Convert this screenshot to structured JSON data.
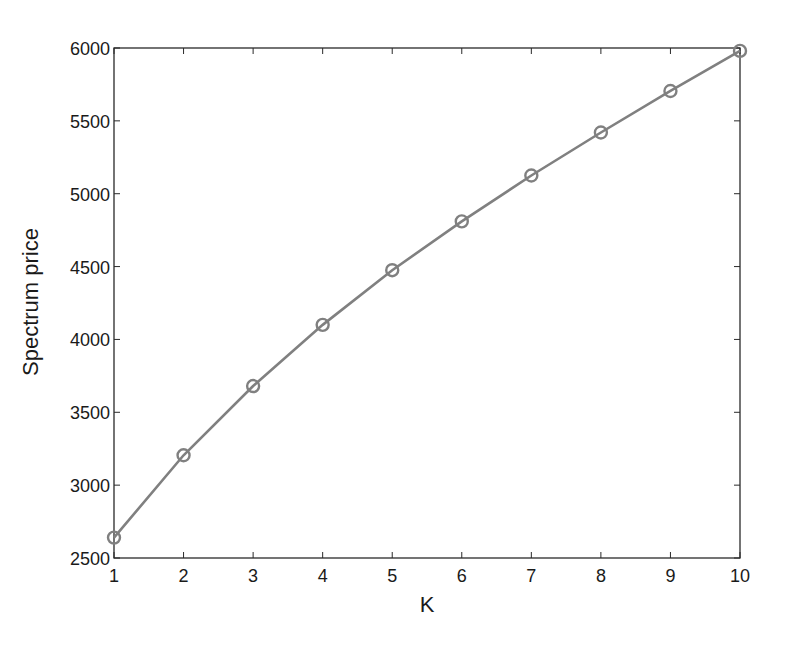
{
  "chart_data": {
    "type": "line",
    "title": "",
    "xlabel": "K",
    "ylabel": "Spectrum price",
    "x": [
      1,
      2,
      3,
      4,
      5,
      6,
      7,
      8,
      9,
      10
    ],
    "series": [
      {
        "name": "Spectrum price",
        "values": [
          2640,
          3205,
          3680,
          4100,
          4475,
          4810,
          5125,
          5420,
          5705,
          5980
        ],
        "color": "#808080",
        "marker": "circle"
      }
    ],
    "xlim": [
      1,
      10
    ],
    "ylim": [
      2500,
      6000
    ],
    "xticks": [
      "1",
      "2",
      "3",
      "4",
      "5",
      "6",
      "7",
      "8",
      "9",
      "10"
    ],
    "yticks": [
      "2500",
      "3000",
      "3500",
      "4000",
      "4500",
      "5000",
      "5500",
      "6000"
    ],
    "grid": false,
    "legend": "none"
  }
}
